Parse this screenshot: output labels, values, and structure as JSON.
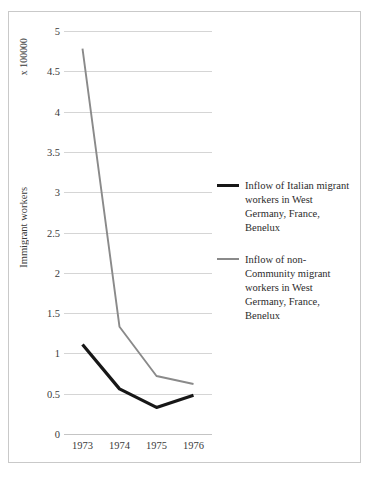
{
  "chart_data": {
    "type": "line",
    "title": "",
    "xlabel": "",
    "ylabel": "Immigrant workers",
    "unit_note": "x 100000",
    "categories": [
      "1973",
      "1974",
      "1975",
      "1976"
    ],
    "ylim": [
      0,
      5
    ],
    "ytick_labels": [
      "0",
      "0.5",
      "1",
      "1.5",
      "2",
      "2.5",
      "3",
      "3.5",
      "4",
      "4.5",
      "5"
    ],
    "ytick_values": [
      0,
      0.5,
      1,
      1.5,
      2,
      2.5,
      3,
      3.5,
      4,
      4.5,
      5
    ],
    "grid": true,
    "legend_position": "right",
    "series": [
      {
        "name": "Inflow of Italian migrant workers in West Germany, France, Benelux",
        "color": "#171717",
        "values": [
          1.11,
          0.56,
          0.33,
          0.48
        ]
      },
      {
        "name": "Inflow of non-Community migrant workers in West Germany, France, Benelux",
        "color": "#8a8a8a",
        "values": [
          4.78,
          1.33,
          0.72,
          0.62
        ]
      }
    ]
  },
  "legend": {
    "entries": [
      {
        "label": "Inflow of Italian migrant workers in West Germany, France, Benelux",
        "icon": "line-swatch-black"
      },
      {
        "label": "Inflow of non-Community migrant workers in West Germany, France, Benelux",
        "icon": "line-swatch-gray"
      }
    ]
  },
  "axis": {
    "unit_note": "x 100000",
    "y_title": "Immigrant workers"
  },
  "colors": {
    "series_italian": "#171717",
    "series_non_community": "#8a8a8a",
    "gridline": "#d5d5d5",
    "frame": "#c9c9c9",
    "text": "#2b2b2b",
    "background": "#ffffff"
  }
}
